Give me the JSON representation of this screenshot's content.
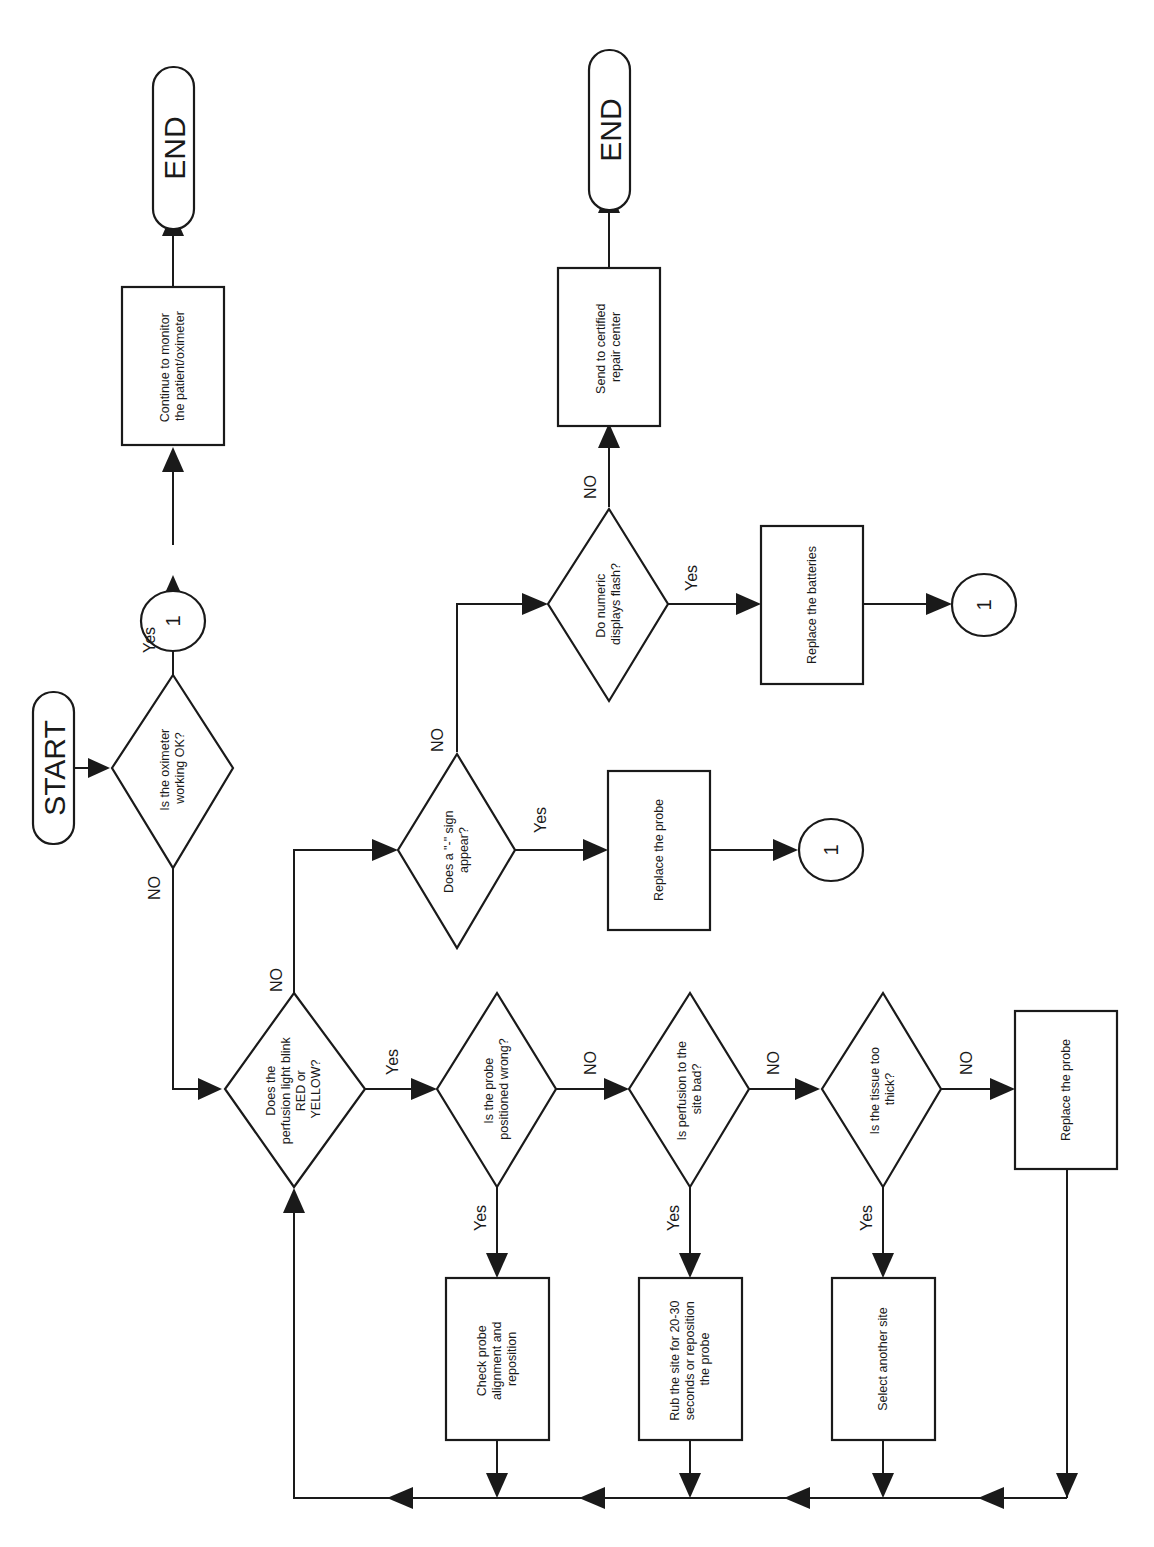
{
  "diagram": {
    "type": "flowchart",
    "orientation": "rotated-90-ccw",
    "nodes": {
      "start": {
        "shape": "terminal",
        "text": "START"
      },
      "d_ok": {
        "shape": "decision",
        "lines": [
          "Is the oximeter",
          "working OK?"
        ]
      },
      "c_top": {
        "shape": "connector",
        "text": "1"
      },
      "p_continue": {
        "shape": "process",
        "lines": [
          "Continue to monitor",
          "the patient/oximeter"
        ]
      },
      "end_top": {
        "shape": "terminal",
        "text": "END"
      },
      "d_perf": {
        "shape": "decision",
        "lines": [
          "Does the",
          "perfusion light blink",
          "RED or",
          "YELLOW?"
        ]
      },
      "d_sign": {
        "shape": "decision",
        "lines": [
          "Does a \"-\" sign",
          "appear?"
        ]
      },
      "p_replace_probe_1": {
        "shape": "process",
        "lines": [
          "Replace the probe"
        ]
      },
      "c_mid": {
        "shape": "connector",
        "text": "1"
      },
      "d_flash": {
        "shape": "decision",
        "lines": [
          "Do numeric",
          "displays flash?"
        ]
      },
      "p_batteries": {
        "shape": "process",
        "lines": [
          "Replace the batteries"
        ]
      },
      "c_right": {
        "shape": "connector",
        "text": "1"
      },
      "p_repair": {
        "shape": "process",
        "lines": [
          "Send to certified",
          "repair center"
        ]
      },
      "end_mid": {
        "shape": "terminal",
        "text": "END"
      },
      "d_pos": {
        "shape": "decision",
        "lines": [
          "Is the probe",
          "positioned wrong?"
        ]
      },
      "p_check": {
        "shape": "process",
        "lines": [
          "Check probe",
          "alignment and",
          "reposition"
        ]
      },
      "d_site": {
        "shape": "decision",
        "lines": [
          "Is perfusion to the",
          "site bad?"
        ]
      },
      "p_rub": {
        "shape": "process",
        "lines": [
          "Rub the site for 20-30",
          "seconds or reposition",
          "the probe"
        ]
      },
      "d_tissue": {
        "shape": "decision",
        "lines": [
          "Is the tissue too",
          "thick?"
        ]
      },
      "p_select": {
        "shape": "process",
        "lines": [
          "Select another site"
        ]
      },
      "p_replace_probe_2": {
        "shape": "process",
        "lines": [
          "Replace the probe"
        ]
      }
    },
    "edges": [
      {
        "from": "start",
        "to": "d_ok",
        "label": ""
      },
      {
        "from": "d_ok",
        "to": "c_top",
        "label": "Yes"
      },
      {
        "from": "c_top",
        "to": "p_continue",
        "label": ""
      },
      {
        "from": "p_continue",
        "to": "end_top",
        "label": ""
      },
      {
        "from": "d_ok",
        "to": "d_perf",
        "label": "NO"
      },
      {
        "from": "d_perf",
        "to": "d_sign",
        "label": "NO"
      },
      {
        "from": "d_sign",
        "to": "p_replace_probe_1",
        "label": "Yes"
      },
      {
        "from": "p_replace_probe_1",
        "to": "c_mid",
        "label": ""
      },
      {
        "from": "d_sign",
        "to": "d_flash",
        "label": "NO"
      },
      {
        "from": "d_flash",
        "to": "p_batteries",
        "label": "Yes"
      },
      {
        "from": "p_batteries",
        "to": "c_right",
        "label": ""
      },
      {
        "from": "d_flash",
        "to": "p_repair",
        "label": "NO"
      },
      {
        "from": "p_repair",
        "to": "end_mid",
        "label": ""
      },
      {
        "from": "d_perf",
        "to": "d_pos",
        "label": "Yes"
      },
      {
        "from": "d_pos",
        "to": "p_check",
        "label": "Yes"
      },
      {
        "from": "d_pos",
        "to": "d_site",
        "label": "NO"
      },
      {
        "from": "d_site",
        "to": "p_rub",
        "label": "Yes"
      },
      {
        "from": "d_site",
        "to": "d_tissue",
        "label": "NO"
      },
      {
        "from": "d_tissue",
        "to": "p_select",
        "label": "Yes"
      },
      {
        "from": "d_tissue",
        "to": "p_replace_probe_2",
        "label": "NO"
      },
      {
        "from": "p_check",
        "to": "d_perf",
        "label": ""
      },
      {
        "from": "p_rub",
        "to": "d_perf",
        "label": ""
      },
      {
        "from": "p_select",
        "to": "d_perf",
        "label": ""
      },
      {
        "from": "p_replace_probe_2",
        "to": "d_perf",
        "label": ""
      }
    ]
  },
  "labels": {
    "yes": "Yes",
    "no": "NO"
  }
}
